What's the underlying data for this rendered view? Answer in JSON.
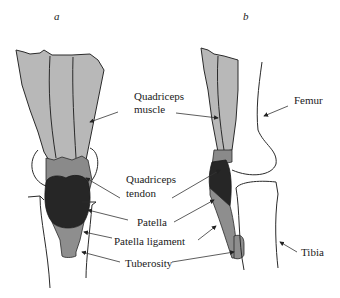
{
  "figure": {
    "panels": {
      "a": "a",
      "b": "b"
    },
    "labels": {
      "quadriceps_muscle_line1": "Quadriceps",
      "quadriceps_muscle_line2": "muscle",
      "quadriceps_tendon_line1": "Quadriceps",
      "quadriceps_tendon_line2": "tendon",
      "patella": "Patella",
      "patella_ligament": "Patella ligament",
      "tuberosity": "Tuberosity",
      "femur": "Femur",
      "tibia": "Tibia"
    },
    "colors": {
      "muscle": "#b8b8b8",
      "tendon": "#8a8a8a",
      "patella": "#262626",
      "ligament": "#8e8e8e"
    }
  }
}
